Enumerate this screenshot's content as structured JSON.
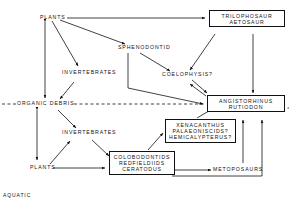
{
  "figure": {
    "type": "diagram",
    "subtype": "food-web",
    "caption_corner": "AQUATIC",
    "line_color": "#111111",
    "background": "#ffffff"
  },
  "nodes": {
    "plants_top": {
      "label": "PLANTS",
      "x": 40,
      "y": 15,
      "boxed": false
    },
    "sphenodontid": {
      "label": "SPHENODONTID",
      "x": 118,
      "y": 48,
      "boxed": false
    },
    "invertebrates_upper": {
      "label": "INVERTEBRATES",
      "x": 62,
      "y": 73,
      "boxed": false
    },
    "organic_debris": {
      "label": "ORGANIC DEBRIS",
      "x": 18,
      "y": 104,
      "boxed": false
    },
    "invertebrates_lower": {
      "label": "INVERTEBRATES",
      "x": 62,
      "y": 133,
      "boxed": false
    },
    "plants_bottom": {
      "label": "PLANTS",
      "x": 32,
      "y": 165,
      "boxed": false
    },
    "coelophysis": {
      "label": "COELOPHYSIS?",
      "x": 163,
      "y": 76,
      "boxed": false
    },
    "metoposaurs": {
      "label": "METOPOSAURS",
      "x": 215,
      "y": 167,
      "boxed": false
    },
    "trilophosaur_box": {
      "rows": [
        "TRILOPHOSAUR",
        "AETOSAUR"
      ],
      "x": 209,
      "y": 11,
      "w": 72,
      "boxed": true
    },
    "angistorhinus_box": {
      "rows": [
        "ANGISTORHINUS",
        "RUTIODON"
      ],
      "x": 207,
      "y": 96,
      "w": 74,
      "boxed": true
    },
    "xenacanthus_box": {
      "rows": [
        "XENACANTHUS",
        "PALAEONISCIDS?",
        "HEMICALYPTERUS?"
      ],
      "x": 166,
      "y": 120,
      "w": 68,
      "boxed": true
    },
    "colobodontids_box": {
      "rows": [
        "COLOBODONTIDS",
        "REDFIELDIIDS",
        "CERATODUS"
      ],
      "x": 109,
      "y": 152,
      "w": 62,
      "boxed": true
    }
  },
  "edges": [
    {
      "from": "plants_top",
      "to": "trilophosaur_box",
      "style": "solid"
    },
    {
      "from": "plants_top",
      "to": "sphenodontid",
      "style": "solid"
    },
    {
      "from": "plants_top",
      "to": "invertebrates_upper",
      "style": "solid"
    },
    {
      "from": "plants_top",
      "to": "organic_debris",
      "style": "solid",
      "bidirectional": true
    },
    {
      "from": "sphenodontid",
      "to": "coelophysis",
      "style": "solid"
    },
    {
      "from": "sphenodontid",
      "to": "angistorhinus_box",
      "style": "solid"
    },
    {
      "from": "sphenodontid",
      "to": "organic_debris",
      "style": "solid"
    },
    {
      "from": "trilophosaur_box",
      "to": "coelophysis",
      "style": "solid"
    },
    {
      "from": "trilophosaur_box",
      "to": "angistorhinus_box",
      "style": "solid"
    },
    {
      "from": "coelophysis",
      "to": "angistorhinus_box",
      "style": "solid",
      "bidirectional": true
    },
    {
      "from": "invertebrates_upper",
      "to": "organic_debris",
      "style": "solid"
    },
    {
      "from": "organic_debris",
      "to": "invertebrates_lower",
      "style": "solid"
    },
    {
      "from": "organic_debris",
      "to": "plants_bottom",
      "style": "solid",
      "bidirectional": true
    },
    {
      "from": "invertebrates_lower",
      "to": "colobodontids_box",
      "style": "solid"
    },
    {
      "from": "plants_bottom",
      "to": "invertebrates_lower",
      "style": "solid"
    },
    {
      "from": "plants_bottom",
      "to": "colobodontids_box",
      "style": "solid"
    },
    {
      "from": "colobodontids_box",
      "to": "xenacanthus_box",
      "style": "solid"
    },
    {
      "from": "colobodontids_box",
      "to": "metoposaurs",
      "style": "solid"
    },
    {
      "from": "colobodontids_box",
      "to": "angistorhinus_box",
      "style": "solid"
    },
    {
      "from": "xenacanthus_box",
      "to": "angistorhinus_box",
      "style": "solid"
    },
    {
      "from": "metoposaurs",
      "to": "angistorhinus_box",
      "style": "solid"
    },
    {
      "from": "organic_debris",
      "to": "angistorhinus_box",
      "style": "dashed"
    }
  ]
}
